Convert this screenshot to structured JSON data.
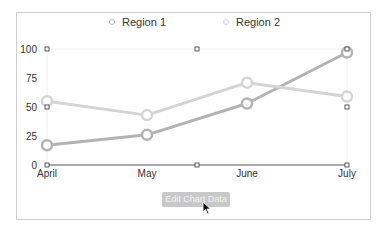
{
  "chart_data": {
    "type": "line",
    "title": "",
    "xlabel": "",
    "ylabel": "",
    "categories": [
      "April",
      "May",
      "June",
      "July"
    ],
    "ylim": [
      0,
      100
    ],
    "yticks": [
      "0",
      "25",
      "50",
      "75",
      "100"
    ],
    "grid": false,
    "legend": "top-center",
    "series": [
      {
        "name": "Region 1",
        "values": [
          17,
          26,
          53,
          97
        ],
        "color": "#b3b3b3"
      },
      {
        "name": "Region 2",
        "values": [
          55,
          43,
          71,
          59
        ],
        "color": "#d4d4d4"
      }
    ]
  },
  "button": {
    "edit_label": "Edit Chart Data"
  }
}
